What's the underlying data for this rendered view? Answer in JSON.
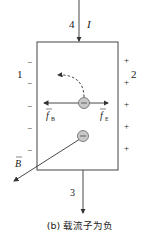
{
  "diagram": {
    "current": {
      "label": "I",
      "top_terminal": "4",
      "bottom_terminal": "3"
    },
    "left_terminal": "1",
    "right_terminal": "2",
    "left_charges": [
      "−",
      "−",
      "−",
      "−",
      "−"
    ],
    "right_charges": [
      "+",
      "+",
      "+",
      "+",
      "+"
    ],
    "force_left_label": "f",
    "force_left_sub": "B",
    "force_right_label": "f",
    "force_right_sub": "E",
    "field_label": "B",
    "carrier_sign": "−",
    "caption": "(b) 载流子为负",
    "colors": {
      "line": "#333333",
      "carrier_fill": "#c8c8c8",
      "carrier_stroke": "#666666",
      "text": "#222222"
    }
  }
}
